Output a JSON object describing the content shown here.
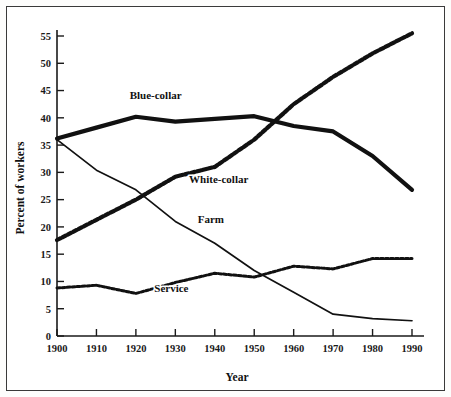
{
  "chart_data": {
    "type": "line",
    "title": "",
    "xlabel": "Year",
    "ylabel": "Percent of workers",
    "x": [
      1900,
      1910,
      1920,
      1930,
      1940,
      1950,
      1960,
      1970,
      1980,
      1990
    ],
    "xlim": [
      1900,
      1990
    ],
    "ylim": [
      0,
      57
    ],
    "xticks": [
      "1900",
      "1910",
      "1920",
      "1930",
      "1940",
      "1950",
      "1960",
      "1970",
      "1980",
      "1990"
    ],
    "yticks": [
      "0",
      "5",
      "10",
      "15",
      "20",
      "25",
      "30",
      "35",
      "40",
      "45",
      "50",
      "55"
    ],
    "grid": false,
    "legend": "inline-labels",
    "series": [
      {
        "name": "Blue-collar",
        "style": "thick-solid",
        "label_x": 1925,
        "label_y": 43.5,
        "values": [
          36.2,
          38.2,
          40.2,
          39.3,
          39.8,
          40.3,
          38.5,
          37.5,
          33.0,
          26.8
        ]
      },
      {
        "name": "White-collar",
        "style": "thick-dotted",
        "label_x": 1941,
        "label_y": 28.0,
        "values": [
          17.6,
          21.3,
          25.0,
          29.2,
          31.0,
          36.0,
          42.5,
          47.5,
          51.8,
          55.5
        ]
      },
      {
        "name": "Farm",
        "style": "thin-solid",
        "label_x": 1939,
        "label_y": 20.8,
        "values": [
          36.0,
          30.4,
          26.8,
          21.0,
          17.0,
          12.0,
          8.0,
          4.0,
          3.2,
          2.8
        ]
      },
      {
        "name": "Service",
        "style": "thin-dotted",
        "label_x": 1929,
        "label_y": 8.0,
        "values": [
          8.8,
          9.3,
          7.8,
          9.8,
          11.5,
          10.8,
          12.8,
          12.3,
          14.2,
          14.2
        ]
      }
    ]
  },
  "axes": {
    "x_title": "Year",
    "y_title": "Percent of workers"
  }
}
